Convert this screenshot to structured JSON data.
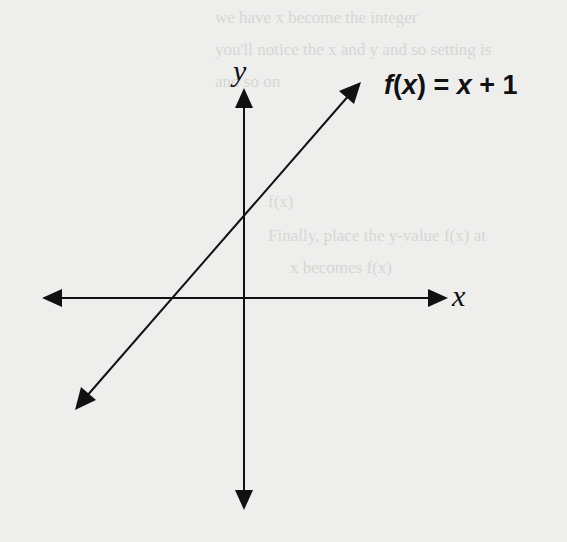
{
  "diagram": {
    "type": "coordinate-graph",
    "function_label": {
      "f": "f",
      "open": "(",
      "var": "x",
      "close": ")",
      "rhs_prefix": " = ",
      "rhs_var": "x",
      "rhs_suffix": " + 1"
    },
    "axes": {
      "x_label": "x",
      "y_label": "y"
    },
    "line": {
      "equation": "f(x) = x + 1",
      "slope": 1,
      "y_intercept": 1,
      "x_intercept": -1
    },
    "colors": {
      "background": "#eeeeec",
      "ink": "#111111"
    }
  },
  "bleed_through_text": [
    "we have x become the integer",
    "you'll notice the x and y and so setting is",
    "and so on",
    "f(x)",
    "Finally, place the y-value f(x) at",
    "x becomes f(x)"
  ]
}
